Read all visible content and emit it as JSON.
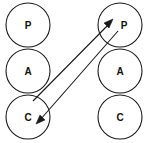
{
  "canvas": {
    "width": 146,
    "height": 143,
    "background": "#ffffff",
    "stroke_color": "#1a1a1a",
    "label_color": "#111111"
  },
  "diagram": {
    "type": "node-link",
    "title": "",
    "columns": [
      {
        "name": "left-column",
        "cx": 28,
        "nodes": [
          {
            "id": "left-p",
            "label": "P",
            "cx": 28,
            "cy": 25,
            "r": 22
          },
          {
            "id": "left-a",
            "label": "A",
            "cx": 28,
            "cy": 71,
            "r": 22
          },
          {
            "id": "left-c",
            "label": "C",
            "cx": 28,
            "cy": 117,
            "r": 22
          }
        ]
      },
      {
        "name": "right-column",
        "cx": 120,
        "nodes": [
          {
            "id": "right-p",
            "label": "P",
            "cx": 120,
            "cy": 25,
            "r": 22
          },
          {
            "id": "right-a",
            "label": "A",
            "cx": 120,
            "cy": 71,
            "r": 22
          },
          {
            "id": "right-c",
            "label": "C",
            "cx": 120,
            "cy": 117,
            "r": 22
          }
        ]
      }
    ],
    "edges": [
      {
        "id": "edge-left-c-to-right-p",
        "from": "left-c",
        "to": "right-p",
        "label": "",
        "direction": "up-right",
        "x1": 33,
        "y1": 101,
        "x2": 112,
        "y2": 21,
        "arrowhead": "at-end"
      },
      {
        "id": "edge-right-p-to-left-c",
        "from": "right-p",
        "to": "left-c",
        "label": "",
        "direction": "down-left",
        "x1": 118,
        "y1": 31,
        "x2": 38,
        "y2": 123,
        "arrowhead": "at-end"
      }
    ]
  }
}
